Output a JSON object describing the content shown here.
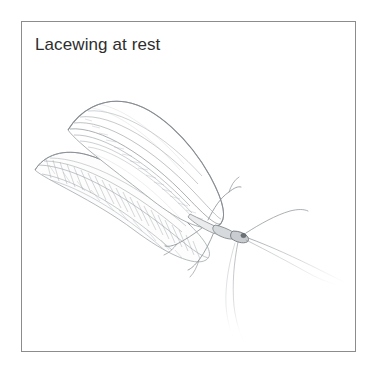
{
  "canvas": {
    "width": 378,
    "height": 376,
    "background_color": "#ffffff"
  },
  "figure": {
    "caption": "Lacewing at rest",
    "caption_color": "#2e2e2e",
    "frame": {
      "border_color": "#8c8c8c",
      "background_color": "#ffffff",
      "x": 21,
      "y": 21,
      "width": 335,
      "height": 331
    },
    "illustration": {
      "subject": "lacewing-insect",
      "technique": "pencil-line-drawing",
      "ink_color": "#9aa0a6",
      "accent_color": "#6f757b",
      "orientation": "wings folded tent-like over body, angled up toward upper-left, head and antennae toward lower-right",
      "parts": [
        "forewing",
        "hindwing",
        "wing-venation",
        "thorax",
        "abdomen",
        "head",
        "eye",
        "antenna-right",
        "antenna-trailing",
        "foreleg",
        "midleg",
        "hindleg"
      ]
    }
  }
}
